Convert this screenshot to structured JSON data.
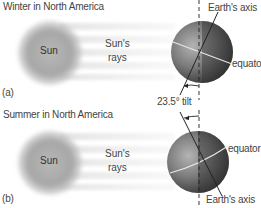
{
  "panels": [
    {
      "title": "Winter in North America",
      "letter": "(a)",
      "sun_label": "Sun",
      "rays_label_1": "Sun's",
      "rays_label_2": "rays",
      "axis_label": "Earth's axis",
      "equator_label": "equator"
    },
    {
      "title": "Summer in North America",
      "letter": "(b)",
      "sun_label": "Sun",
      "rays_label_1": "Sun's",
      "rays_label_2": "rays",
      "axis_label": "Earth's axis",
      "equator_label": "equator"
    }
  ],
  "tilt_label": "23.5° tilt",
  "colors": {
    "sun": "#a8a8a8",
    "earth_light": "#9a9a9a",
    "earth_dark": "#3a3a3a",
    "rays": "#dcdcdc",
    "axis_line": "#222222"
  }
}
